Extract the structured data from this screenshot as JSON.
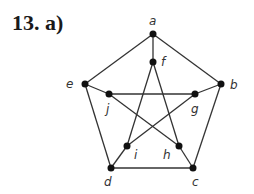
{
  "title": "13. a)",
  "graph": {
    "nodes": [
      {
        "id": "a",
        "x": 153,
        "y": 34,
        "lx": 149,
        "ly": 25
      },
      {
        "id": "f",
        "x": 153,
        "y": 62,
        "lx": 161,
        "ly": 66
      },
      {
        "id": "e",
        "x": 85,
        "y": 84,
        "lx": 66,
        "ly": 88
      },
      {
        "id": "b",
        "x": 221,
        "y": 84,
        "lx": 230,
        "ly": 89
      },
      {
        "id": "j",
        "x": 109,
        "y": 94,
        "lx": 106,
        "ly": 113
      },
      {
        "id": "g",
        "x": 195,
        "y": 94,
        "lx": 191,
        "ly": 113
      },
      {
        "id": "i",
        "x": 127,
        "y": 146,
        "lx": 134,
        "ly": 159
      },
      {
        "id": "h",
        "x": 179,
        "y": 146,
        "lx": 163,
        "ly": 159
      },
      {
        "id": "d",
        "x": 111,
        "y": 168,
        "lx": 104,
        "ly": 186
      },
      {
        "id": "c",
        "x": 193,
        "y": 168,
        "lx": 192,
        "ly": 186
      }
    ],
    "edges": [
      [
        "a",
        "f"
      ],
      [
        "a",
        "e"
      ],
      [
        "a",
        "b"
      ],
      [
        "e",
        "d"
      ],
      [
        "b",
        "c"
      ],
      [
        "d",
        "c"
      ],
      [
        "e",
        "j"
      ],
      [
        "j",
        "h"
      ],
      [
        "j",
        "g"
      ],
      [
        "b",
        "g"
      ],
      [
        "g",
        "i"
      ],
      [
        "f",
        "i"
      ],
      [
        "f",
        "h"
      ],
      [
        "i",
        "d"
      ],
      [
        "h",
        "c"
      ]
    ]
  },
  "colors": {
    "line": "#333333",
    "node": "#111111"
  }
}
